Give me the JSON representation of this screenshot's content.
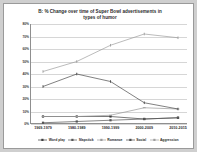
{
  "chart_data": {
    "type": "line",
    "title": "B: % Change over time of Super Bowl advertisements in types of humor",
    "title_line1": "B: % Change over time of Super Bowl advertisements in",
    "title_line2": "types of humor",
    "xlabel": "",
    "ylabel": "",
    "categories": [
      "1969-1979",
      "1980-1989",
      "1990-1999",
      "2000-2009",
      "2010-2015"
    ],
    "ylim": [
      0,
      80
    ],
    "yticks": [
      0,
      10,
      20,
      30,
      40,
      50,
      60,
      70,
      80
    ],
    "yticklabels": [
      "0%",
      "10%",
      "20%",
      "30%",
      "40%",
      "50%",
      "60%",
      "70%",
      "80%"
    ],
    "grid": true,
    "legend_position": "bottom",
    "series": [
      {
        "name": "Word play",
        "values": [
          6,
          6,
          6,
          4,
          5
        ],
        "color": "#3d3d3d",
        "marker": "square"
      },
      {
        "name": "Slapstick",
        "values": [
          1,
          2,
          3,
          4,
          5
        ],
        "color": "#555555",
        "marker": "square"
      },
      {
        "name": "Romance",
        "values": [
          6,
          6,
          7,
          13,
          12
        ],
        "color": "#9a9a9a",
        "marker": "dash"
      },
      {
        "name": "Social",
        "values": [
          30,
          40,
          34,
          17,
          12
        ],
        "color": "#4a4a4a",
        "marker": "tick"
      },
      {
        "name": "Aggression",
        "values": [
          42,
          50,
          63,
          72,
          69
        ],
        "color": "#9e9e9e",
        "marker": "tick"
      }
    ]
  }
}
